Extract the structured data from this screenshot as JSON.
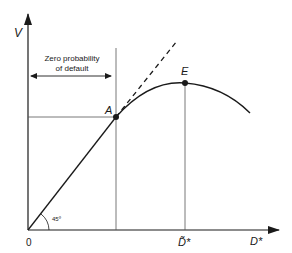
{
  "diagram": {
    "axes": {
      "y_label": "V",
      "x_label": "D*",
      "origin_label": "0",
      "x_tick_label": "D̃*"
    },
    "annotation": {
      "line1": "Zero probability",
      "line2": "of default"
    },
    "angle_label": "45º",
    "points": {
      "A": "A",
      "E": "E"
    },
    "colors": {
      "line": "#1a1a1a",
      "guide": "#555555",
      "background": "#ffffff"
    }
  }
}
